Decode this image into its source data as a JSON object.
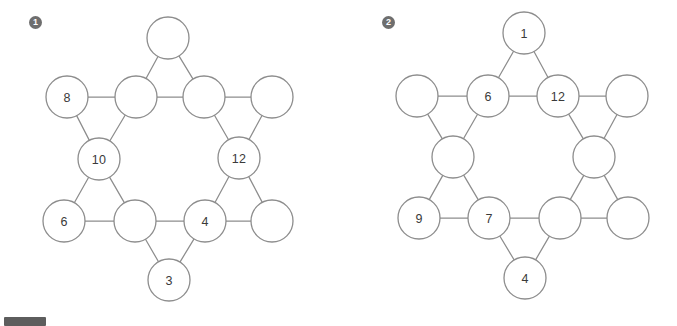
{
  "page": {
    "background_color": "#ffffff",
    "stroke_color": "#8d8d8d",
    "label_color": "#3a3a3a",
    "badge_color": "#6e6e6e"
  },
  "corner_bar": {
    "name": "bottom-left-bar",
    "color": "#5d5d5d"
  },
  "puzzles": [
    {
      "badge": "1",
      "nodes": [
        {
          "id": "top",
          "cx": 168,
          "cy": 38,
          "r": 21,
          "label": ""
        },
        {
          "id": "upper-left",
          "cx": 67,
          "cy": 97,
          "r": 21,
          "label": "8"
        },
        {
          "id": "inner-upper-left",
          "cx": 136,
          "cy": 97,
          "r": 21,
          "label": ""
        },
        {
          "id": "inner-upper-right",
          "cx": 204,
          "cy": 97,
          "r": 21,
          "label": ""
        },
        {
          "id": "upper-right",
          "cx": 272,
          "cy": 97,
          "r": 21,
          "label": ""
        },
        {
          "id": "inner-left",
          "cx": 99,
          "cy": 159,
          "r": 21,
          "label": "10"
        },
        {
          "id": "inner-right",
          "cx": 239,
          "cy": 158,
          "r": 21,
          "label": "12"
        },
        {
          "id": "lower-left",
          "cx": 64,
          "cy": 221,
          "r": 21,
          "label": "6"
        },
        {
          "id": "inner-lower-left",
          "cx": 135,
          "cy": 221,
          "r": 21,
          "label": ""
        },
        {
          "id": "inner-lower-right",
          "cx": 205,
          "cy": 221,
          "r": 21,
          "label": "4"
        },
        {
          "id": "lower-right",
          "cx": 272,
          "cy": 221,
          "r": 21,
          "label": ""
        },
        {
          "id": "bottom",
          "cx": 169,
          "cy": 280,
          "r": 21,
          "label": "3"
        }
      ],
      "edges": [
        [
          "top",
          "inner-upper-left"
        ],
        [
          "top",
          "inner-upper-right"
        ],
        [
          "upper-left",
          "inner-upper-left"
        ],
        [
          "inner-upper-left",
          "inner-upper-right"
        ],
        [
          "inner-upper-right",
          "upper-right"
        ],
        [
          "upper-left",
          "inner-left"
        ],
        [
          "inner-upper-left",
          "inner-left"
        ],
        [
          "inner-upper-right",
          "inner-right"
        ],
        [
          "upper-right",
          "inner-right"
        ],
        [
          "inner-left",
          "lower-left"
        ],
        [
          "inner-left",
          "inner-lower-left"
        ],
        [
          "inner-right",
          "inner-lower-right"
        ],
        [
          "inner-right",
          "lower-right"
        ],
        [
          "lower-left",
          "inner-lower-left"
        ],
        [
          "inner-lower-left",
          "inner-lower-right"
        ],
        [
          "inner-lower-right",
          "lower-right"
        ],
        [
          "inner-lower-left",
          "bottom"
        ],
        [
          "inner-lower-right",
          "bottom"
        ]
      ]
    },
    {
      "badge": "2",
      "nodes": [
        {
          "id": "top",
          "cx": 184,
          "cy": 33,
          "r": 21,
          "label": "1"
        },
        {
          "id": "upper-left",
          "cx": 77,
          "cy": 96,
          "r": 21,
          "label": ""
        },
        {
          "id": "inner-upper-left",
          "cx": 148,
          "cy": 96,
          "r": 21,
          "label": "6"
        },
        {
          "id": "inner-upper-right",
          "cx": 218,
          "cy": 96,
          "r": 21,
          "label": "12"
        },
        {
          "id": "upper-right",
          "cx": 287,
          "cy": 96,
          "r": 21,
          "label": ""
        },
        {
          "id": "inner-left",
          "cx": 113,
          "cy": 157,
          "r": 21,
          "label": ""
        },
        {
          "id": "inner-right",
          "cx": 254,
          "cy": 157,
          "r": 21,
          "label": ""
        },
        {
          "id": "lower-left",
          "cx": 79,
          "cy": 218,
          "r": 21,
          "label": "9"
        },
        {
          "id": "inner-lower-left",
          "cx": 149,
          "cy": 218,
          "r": 21,
          "label": "7"
        },
        {
          "id": "inner-lower-right",
          "cx": 220,
          "cy": 218,
          "r": 21,
          "label": ""
        },
        {
          "id": "lower-right",
          "cx": 288,
          "cy": 218,
          "r": 21,
          "label": ""
        },
        {
          "id": "bottom",
          "cx": 185,
          "cy": 278,
          "r": 21,
          "label": "4"
        }
      ],
      "edges": [
        [
          "top",
          "inner-upper-left"
        ],
        [
          "top",
          "inner-upper-right"
        ],
        [
          "upper-left",
          "inner-upper-left"
        ],
        [
          "inner-upper-left",
          "inner-upper-right"
        ],
        [
          "inner-upper-right",
          "upper-right"
        ],
        [
          "upper-left",
          "inner-left"
        ],
        [
          "inner-upper-left",
          "inner-left"
        ],
        [
          "inner-upper-right",
          "inner-right"
        ],
        [
          "upper-right",
          "inner-right"
        ],
        [
          "inner-left",
          "lower-left"
        ],
        [
          "inner-left",
          "inner-lower-left"
        ],
        [
          "inner-right",
          "inner-lower-right"
        ],
        [
          "inner-right",
          "lower-right"
        ],
        [
          "lower-left",
          "inner-lower-left"
        ],
        [
          "inner-lower-left",
          "inner-lower-right"
        ],
        [
          "inner-lower-right",
          "lower-right"
        ],
        [
          "inner-lower-left",
          "bottom"
        ],
        [
          "inner-lower-right",
          "bottom"
        ]
      ]
    }
  ]
}
